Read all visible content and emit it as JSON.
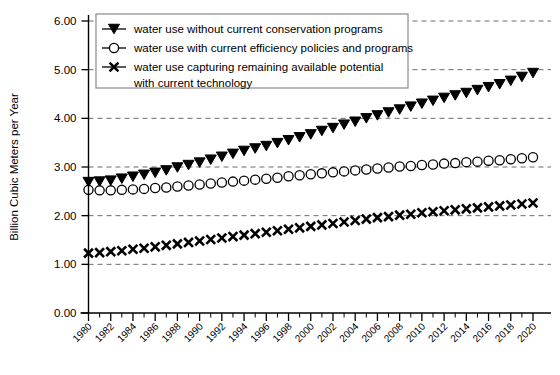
{
  "chart_data": {
    "type": "line",
    "title": "",
    "xlabel": "",
    "ylabel": "Billion Cubic Meters per Year",
    "xlim": [
      1980,
      2020
    ],
    "ylim": [
      0.0,
      6.0
    ],
    "ytick_step": 1.0,
    "xtick_step": 2,
    "minor_xtick_step": 1,
    "grid": true,
    "grid_axis": "y",
    "legend_position": "top-left-inside",
    "ytick_labels": [
      "0.00",
      "1.00",
      "2.00",
      "3.00",
      "4.00",
      "5.00",
      "6.00"
    ],
    "ytick_values": [
      0.0,
      1.0,
      2.0,
      3.0,
      4.0,
      5.0,
      6.0
    ],
    "xtick_labels": [
      "1980",
      "1982",
      "1984",
      "1986",
      "1988",
      "1990",
      "1992",
      "1994",
      "1996",
      "1998",
      "2000",
      "2002",
      "2004",
      "2006",
      "2008",
      "2010",
      "2012",
      "2014",
      "2016",
      "2018",
      "2020"
    ],
    "xtick_values": [
      1980,
      1982,
      1984,
      1986,
      1988,
      1990,
      1992,
      1994,
      1996,
      1998,
      2000,
      2002,
      2004,
      2006,
      2008,
      2010,
      2012,
      2014,
      2016,
      2018,
      2020
    ],
    "x": [
      1980,
      1981,
      1982,
      1983,
      1984,
      1985,
      1986,
      1987,
      1988,
      1989,
      1990,
      1991,
      1992,
      1993,
      1994,
      1995,
      1996,
      1997,
      1998,
      1999,
      2000,
      2001,
      2002,
      2003,
      2004,
      2005,
      2006,
      2007,
      2008,
      2009,
      2010,
      2011,
      2012,
      2013,
      2014,
      2015,
      2016,
      2017,
      2018,
      2019,
      2020
    ],
    "series": [
      {
        "name": "water use without current conservation programs",
        "marker": "triangle-down-filled",
        "values": [
          2.69,
          2.7,
          2.72,
          2.76,
          2.8,
          2.84,
          2.88,
          2.93,
          2.99,
          3.04,
          3.09,
          3.15,
          3.21,
          3.27,
          3.33,
          3.38,
          3.43,
          3.49,
          3.55,
          3.61,
          3.67,
          3.74,
          3.8,
          3.87,
          3.93,
          4.0,
          4.06,
          4.12,
          4.18,
          4.24,
          4.3,
          4.36,
          4.42,
          4.47,
          4.52,
          4.58,
          4.64,
          4.7,
          4.77,
          4.85,
          4.93
        ]
      },
      {
        "name": "water use with current efficiency policies and programs",
        "marker": "circle-open",
        "values": [
          2.53,
          2.52,
          2.52,
          2.53,
          2.54,
          2.55,
          2.57,
          2.58,
          2.6,
          2.62,
          2.64,
          2.66,
          2.68,
          2.7,
          2.72,
          2.74,
          2.76,
          2.78,
          2.81,
          2.83,
          2.85,
          2.87,
          2.89,
          2.91,
          2.93,
          2.95,
          2.97,
          2.99,
          3.01,
          3.02,
          3.04,
          3.05,
          3.07,
          3.08,
          3.1,
          3.11,
          3.13,
          3.14,
          3.16,
          3.18,
          3.2
        ]
      },
      {
        "name": "water use capturing remaining available potential with current technology",
        "marker": "x-filled",
        "values": [
          1.23,
          1.24,
          1.26,
          1.28,
          1.31,
          1.33,
          1.36,
          1.39,
          1.42,
          1.45,
          1.48,
          1.51,
          1.54,
          1.57,
          1.6,
          1.63,
          1.66,
          1.69,
          1.72,
          1.75,
          1.78,
          1.81,
          1.84,
          1.87,
          1.9,
          1.93,
          1.96,
          1.98,
          2.01,
          2.03,
          2.06,
          2.08,
          2.1,
          2.12,
          2.14,
          2.16,
          2.18,
          2.2,
          2.22,
          2.24,
          2.26
        ]
      }
    ],
    "legend_entries": [
      {
        "label_lines": [
          "water use without current conservation programs"
        ],
        "marker": "triangle-down-filled"
      },
      {
        "label_lines": [
          "water use with current efficiency policies and programs"
        ],
        "marker": "circle-open"
      },
      {
        "label_lines": [
          "water use capturing remaining available potential",
          "with current technology"
        ],
        "marker": "x-filled"
      }
    ]
  }
}
